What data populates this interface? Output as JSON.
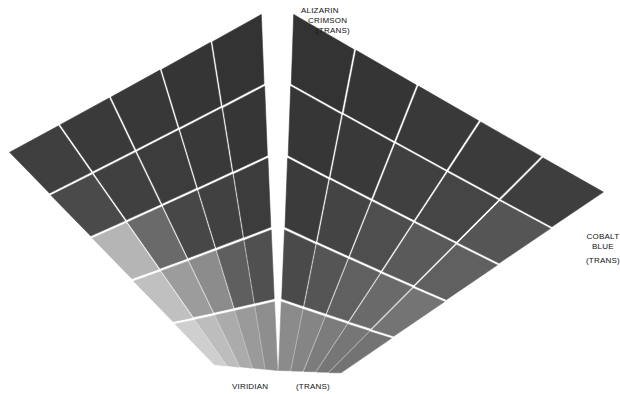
{
  "labels": {
    "top": {
      "line1": "ALIZARIN",
      "line2": "CRIMSON",
      "line3": "(TRANS)"
    },
    "right": {
      "line1": "COBALT",
      "line2": "BLUE",
      "line3": "(TRANS)"
    },
    "bottom_left": "VIRIDIAN",
    "bottom_right": "(TRANS)"
  },
  "colors": {
    "background": "#ffffff",
    "grout": "#ffffff",
    "text": "#111111"
  },
  "geometry": {
    "apex_left": [
      262,
      13
    ],
    "apex_right": [
      293,
      13
    ],
    "ridge_top": [
      278,
      13
    ],
    "ridge_bottom": [
      278,
      372
    ],
    "left_outer_top": [
      8,
      152
    ],
    "left_outer_bottom": [
      40,
      235
    ],
    "left_bottom": [
      215,
      366
    ],
    "right_outer": [
      605,
      192
    ],
    "right_bottom": [
      340,
      374
    ]
  },
  "faces": {
    "left": {
      "name": "viridian-face",
      "rows": 5,
      "cols": 5,
      "shades": [
        [
          "#3f3f3f",
          "#3a3a3a",
          "#383838",
          "#353535",
          "#333333"
        ],
        [
          "#4a4a4a",
          "#404040",
          "#3c3c3c",
          "#393939",
          "#363636"
        ],
        [
          "#b5b5b5",
          "#6a6a6a",
          "#474747",
          "#414141",
          "#3c3c3c"
        ],
        [
          "#c0c0c0",
          "#9c9c9c",
          "#8c8c8c",
          "#5f5f5f",
          "#505050"
        ],
        [
          "#cfcfcf",
          "#bdbdbd",
          "#ababab",
          "#9a9a9a",
          "#8e8e8e"
        ]
      ]
    },
    "right": {
      "name": "cobalt-face",
      "rows": 5,
      "cols": 5,
      "shades": [
        [
          "#333333",
          "#353535",
          "#393939",
          "#3b3b3b",
          "#3e3e3e"
        ],
        [
          "#363636",
          "#393939",
          "#404040",
          "#454545",
          "#555555"
        ],
        [
          "#3b3b3b",
          "#444444",
          "#4e4e4e",
          "#5a5a5a",
          "#606060"
        ],
        [
          "#4a4a4a",
          "#555555",
          "#606060",
          "#6a6a6a",
          "#747474"
        ],
        [
          "#8b8b8b",
          "#858585",
          "#7c7c7c",
          "#767676",
          "#737373"
        ]
      ]
    }
  }
}
